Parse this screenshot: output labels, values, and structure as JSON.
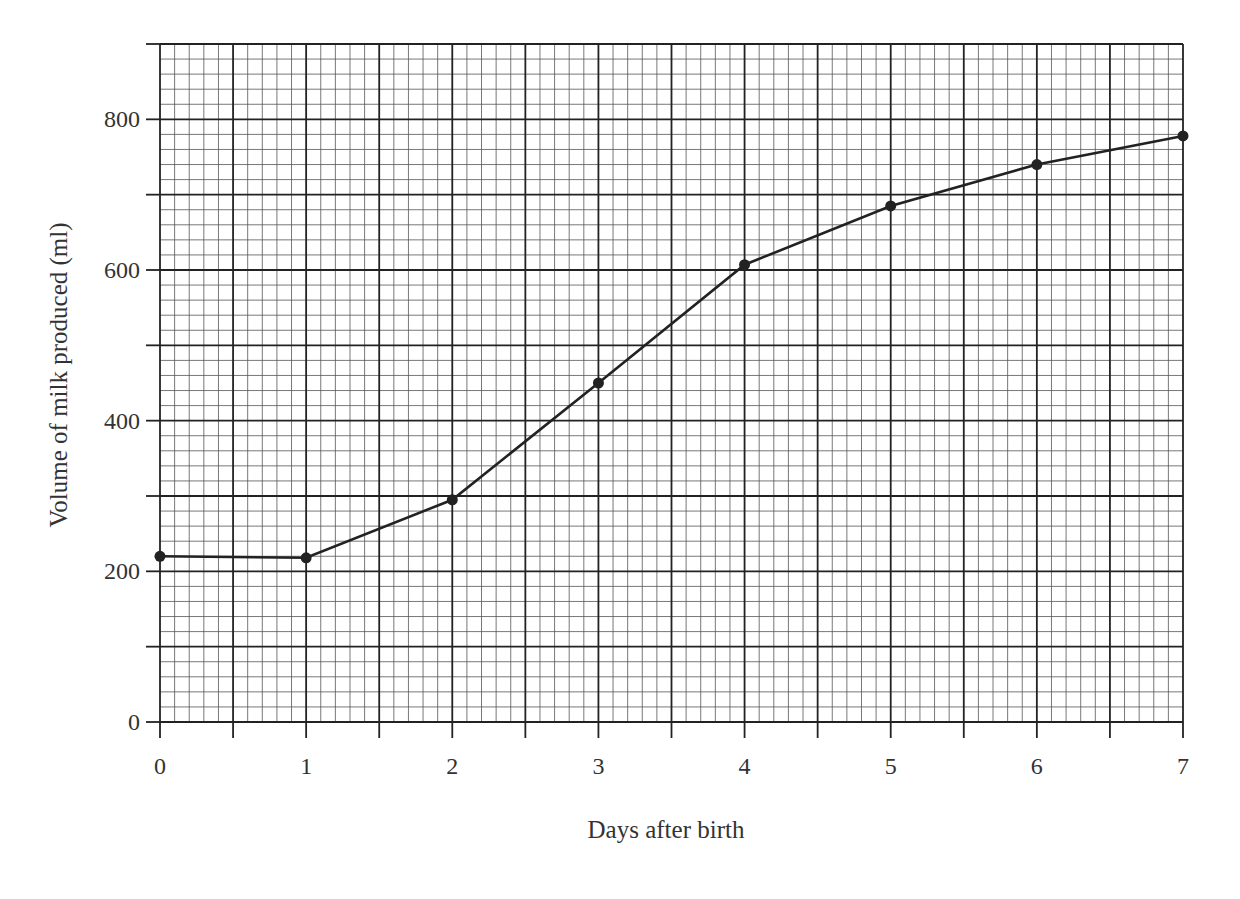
{
  "chart_data": {
    "type": "line",
    "title": "",
    "xlabel": "Days after birth",
    "ylabel": "Volume of milk produced (ml)",
    "x": [
      0,
      1,
      2,
      3,
      4,
      5,
      6,
      7
    ],
    "series": [
      {
        "name": "Volume of milk produced",
        "values": [
          220,
          218,
          295,
          450,
          607,
          685,
          740,
          778
        ],
        "markers": true,
        "color": "#222222"
      }
    ],
    "x_ticks": [
      "0",
      "1",
      "2",
      "3",
      "4",
      "5",
      "6",
      "7"
    ],
    "y_ticks": [
      "0",
      "200",
      "400",
      "600",
      "800"
    ],
    "xlim": [
      0,
      7
    ],
    "ylim": [
      0,
      900
    ],
    "grid": {
      "on": true,
      "style": "graph-paper",
      "major_x_step": 0.5,
      "major_y_step": 100,
      "minor_per_major": 5
    },
    "legend": null
  }
}
